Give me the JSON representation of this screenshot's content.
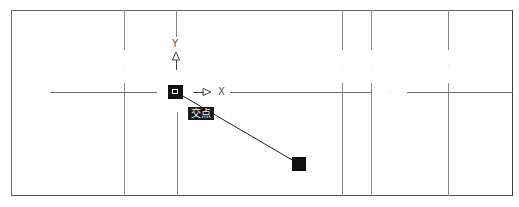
{
  "viewport": {
    "background": "#ffffff",
    "frame_color": "#555555",
    "line_color": "#8a8a8a"
  },
  "ucs_icon": {
    "x_label": "X",
    "y_label": "Y"
  },
  "snap": {
    "tooltip_label": "交点",
    "marker_icon": "intersection-snap-marker"
  },
  "rubber_band": {
    "start": [
      176,
      92
    ],
    "end": [
      299,
      164
    ]
  }
}
